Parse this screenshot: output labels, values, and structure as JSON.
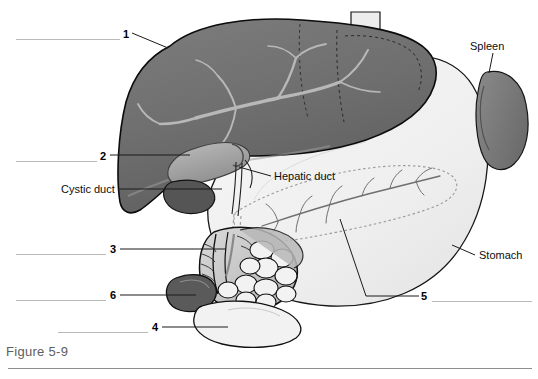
{
  "figure": {
    "caption": "Figure 5-9"
  },
  "colors": {
    "liver_fill": "#6f6f6f",
    "liver_fill_light": "#7c7c7c",
    "liver_vessel": "#b5b5b5",
    "gallbladder_fill": "#a9a9a9",
    "gallbladder_dark": "#4f4f4f",
    "stomach_fill": "#f1f1f1",
    "spleen_fill": "#7a7a7a",
    "pancreas_fill": "#d8d8d8",
    "duodenum_fill": "#c9c9c9",
    "lobule_fill": "#f3f3f3",
    "outline": "#111111",
    "dashed": "#9a9a9a",
    "answer_line": "#b9b9b9",
    "caption_color": "#5e5e5e",
    "background": "#ffffff"
  },
  "named_labels": [
    {
      "id": "spleen",
      "text": "Spleen",
      "x": 470,
      "y": 40,
      "leader": {
        "x1": 493,
        "y1": 53,
        "x2": 489,
        "y2": 73
      }
    },
    {
      "id": "hepatic-duct",
      "text": "Hepatic duct",
      "x": 274,
      "y": 170,
      "leader": {
        "x1": 271,
        "y1": 176,
        "x2": 239,
        "y2": 167
      }
    },
    {
      "id": "cystic-duct",
      "text": "Cystic duct",
      "x": 61,
      "y": 183,
      "leader": {
        "x1": 118,
        "y1": 189,
        "x2": 222,
        "y2": 189
      }
    },
    {
      "id": "stomach",
      "text": "Stomach",
      "x": 479,
      "y": 249,
      "leader": {
        "x1": 475,
        "y1": 255,
        "x2": 452,
        "y2": 245
      }
    }
  ],
  "numbered_labels": [
    {
      "number": "1",
      "num_x": 123,
      "num_y": 28,
      "answer_line": {
        "x": 16,
        "y": 39,
        "width": 104
      },
      "leader": {
        "x1": 132,
        "y1": 33,
        "x2": 168,
        "y2": 48
      }
    },
    {
      "number": "2",
      "num_x": 100,
      "num_y": 150,
      "answer_line": {
        "x": 16,
        "y": 161,
        "width": 81
      },
      "leader": {
        "x1": 110,
        "y1": 155,
        "x2": 190,
        "y2": 155
      }
    },
    {
      "number": "3",
      "num_x": 110,
      "num_y": 243,
      "answer_line": {
        "x": 16,
        "y": 254,
        "width": 90
      },
      "leader": {
        "x1": 120,
        "y1": 249,
        "x2": 226,
        "y2": 249
      }
    },
    {
      "number": "6",
      "num_x": 110,
      "num_y": 289,
      "answer_line": {
        "x": 16,
        "y": 300,
        "width": 90
      },
      "leader": {
        "x1": 120,
        "y1": 295,
        "x2": 196,
        "y2": 295
      }
    },
    {
      "number": "4",
      "num_x": 152,
      "num_y": 321,
      "answer_line": {
        "x": 58,
        "y": 332,
        "width": 90
      },
      "leader": {
        "x1": 162,
        "y1": 327,
        "x2": 228,
        "y2": 327
      }
    },
    {
      "number": "5",
      "num_x": 421,
      "num_y": 290,
      "answer_line": {
        "x": 432,
        "y": 301,
        "width": 100
      },
      "leader": {
        "x1": 419,
        "y1": 296,
        "x2": 340,
        "y2": 219
      }
    }
  ],
  "anatomy": {
    "organs": [
      {
        "name": "liver",
        "label": "Liver",
        "shade": "dark-gray"
      },
      {
        "name": "gallbladder",
        "label": "Gallbladder",
        "shade": "mid-gray"
      },
      {
        "name": "stomach",
        "label": "Stomach",
        "shade": "near-white"
      },
      {
        "name": "spleen",
        "label": "Spleen",
        "shade": "dark-gray"
      },
      {
        "name": "pancreas",
        "label": "Pancreas",
        "shade": "light-gray"
      },
      {
        "name": "duodenum",
        "label": "Duodenum",
        "shade": "light-gray"
      },
      {
        "name": "esophagus",
        "label": "Esophagus",
        "shade": "near-white"
      }
    ]
  }
}
